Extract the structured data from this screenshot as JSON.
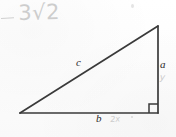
{
  "figure": {
    "background_color": "#fdfdfd",
    "stroke_color": "#3a3a3a",
    "label_color": "#2b2b2b",
    "handwriting_color": "#c9c9c9",
    "geometry": {
      "left_vertex": [
        20,
        113
      ],
      "right_vertex": [
        158,
        113
      ],
      "apex_vertex": [
        158,
        26
      ],
      "right_angle_marker_size": 9,
      "stroke_width": 1.6
    },
    "printed_labels": [
      {
        "name": "hypotenuse-label",
        "text": "c",
        "x": 76,
        "y": 57
      },
      {
        "name": "vertical-leg-label",
        "text": "a",
        "x": 160,
        "y": 59
      },
      {
        "name": "horizontal-leg-label",
        "text": "b",
        "x": 96,
        "y": 113
      }
    ],
    "handwritten_annotations": [
      {
        "name": "expression",
        "text": "3√2",
        "x": 18,
        "y": 3
      },
      {
        "name": "dash-mark",
        "text": "—",
        "x": 1,
        "y": 18
      },
      {
        "name": "vertical-leg-variable",
        "text": "y",
        "x": 160,
        "y": 73
      },
      {
        "name": "horizontal-leg-variable",
        "text": "2x",
        "x": 110,
        "y": 116
      }
    ]
  }
}
